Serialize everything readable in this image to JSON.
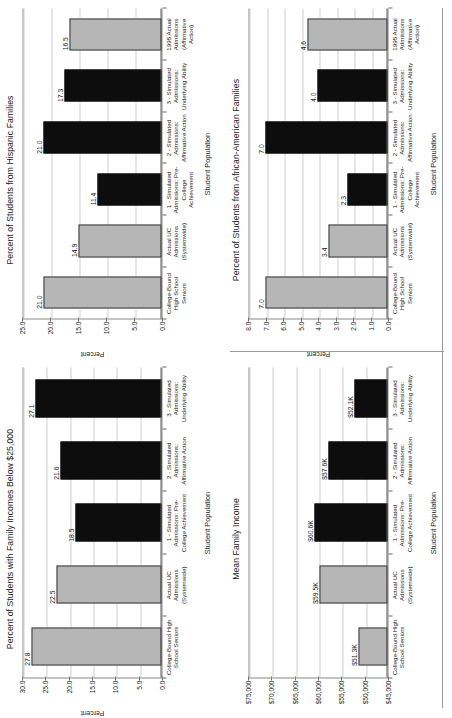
{
  "charts": [
    {
      "id": "hispanic-families",
      "position": "top-left",
      "chart_data": {
        "type": "bar",
        "title": "Percent of Students from Hispanic Families",
        "xlabel": "Student Population",
        "ylabel": "Percent",
        "ylim": [
          0.0,
          25.0
        ],
        "yticks": [
          "0.0",
          "5.0",
          "10.0",
          "15.0",
          "20.0",
          "25.0"
        ],
        "ytickvalues": [
          0,
          5,
          10,
          15,
          20,
          25
        ],
        "grid": true,
        "legend": "none",
        "categories": [
          "College-Bound High School Seniors",
          "Actual UC Admissions (Systemwide)",
          "1 - Simulated Admissions: Pre-College Achievement",
          "2 - Simulated Admissions: Affirmative Action",
          "3 - Simulated Admissions: Underlying Ability",
          "1995 Actual Admissions (Affirmative Action)"
        ],
        "values": [
          21.0,
          14.9,
          11.4,
          21.0,
          17.3,
          16.5
        ],
        "value_labels": [
          "21.0",
          "14.9",
          "11.4",
          "21.0",
          "17.3",
          "16.5"
        ],
        "colors": [
          "gray",
          "gray",
          "black",
          "black",
          "black",
          "gray"
        ]
      }
    },
    {
      "id": "african-american-families",
      "position": "top-right",
      "chart_data": {
        "type": "bar",
        "title": "Percent of Students from African-American Families",
        "xlabel": "Student Population",
        "ylabel": "Percent",
        "ylim": [
          0.0,
          8.0
        ],
        "yticks": [
          "0.0",
          "1.0",
          "2.0",
          "3.0",
          "4.0",
          "5.0",
          "6.0",
          "7.0",
          "8.0"
        ],
        "ytickvalues": [
          0,
          1,
          2,
          3,
          4,
          5,
          6,
          7,
          8
        ],
        "grid": true,
        "legend": "none",
        "categories": [
          "College-Bound High School Seniors",
          "Actual UC Admissions (Systemwide)",
          "1 - Simulated Admissions: Pre-College Achievement",
          "2 - Simulated Admissions: Affirmative Action",
          "3 - Simulated Admissions: Underlying Ability",
          "1995 Actual Admissions (Affirmative Action)"
        ],
        "values": [
          7.0,
          3.4,
          2.3,
          7.0,
          4.0,
          4.6
        ],
        "value_labels": [
          "7.0",
          "3.4",
          "2.3",
          "7.0",
          "4.0",
          "4.6"
        ],
        "colors": [
          "gray",
          "gray",
          "black",
          "black",
          "black",
          "gray"
        ]
      }
    },
    {
      "id": "family-incomes-below-25000",
      "position": "bottom-left",
      "chart_data": {
        "type": "bar",
        "title": "Percent of Students with Family Incomes Below $25,000",
        "xlabel": "Student Population",
        "ylabel": "Percent",
        "ylim": [
          0.0,
          30.0
        ],
        "yticks": [
          "0.0",
          "5.0",
          "10.0",
          "15.0",
          "20.0",
          "25.0",
          "30.0"
        ],
        "ytickvalues": [
          0,
          5,
          10,
          15,
          20,
          25,
          30
        ],
        "grid": true,
        "legend": "none",
        "categories": [
          "College-Bound High School Seniors",
          "Actual UC Admissions (Systemwide)",
          "1 - Simulated Admissions: Pre-College Achievement",
          "2 - Simulated Admissions: Affirmative Action",
          "3 - Simulated Admissions: Underlying Ability"
        ],
        "values": [
          27.8,
          22.5,
          18.5,
          21.6,
          27.1
        ],
        "value_labels": [
          "27.8",
          "22.5",
          "18.5",
          "21.6",
          "27.1"
        ],
        "colors": [
          "gray",
          "gray",
          "black",
          "black",
          "black"
        ]
      }
    },
    {
      "id": "mean-family-income",
      "position": "bottom-right",
      "chart_data": {
        "type": "bar",
        "title": "Mean Family Income",
        "xlabel": "Student Population",
        "ylabel": "",
        "ylim": [
          45000,
          75000
        ],
        "yticks": [
          "$45,000",
          "$50,000",
          "$55,000",
          "$60,000",
          "$65,000",
          "$70,000",
          "$75,000"
        ],
        "ytickvalues": [
          45000,
          50000,
          55000,
          60000,
          65000,
          70000,
          75000
        ],
        "grid": true,
        "legend": "none",
        "categories": [
          "College-Bound High School Seniors",
          "Actual UC Admissions (Systemwide)",
          "1 - Simulated Admissions: Pre-College Achievement",
          "2 - Simulated Admissions: Affirmative Action",
          "3 - Simulated Admissions: Underlying Ability"
        ],
        "values": [
          51300,
          59500,
          60600,
          57600,
          52100
        ],
        "value_labels": [
          "$51.3K",
          "$59.5K",
          "$60.6K",
          "$57.6K",
          "$52.1K"
        ],
        "colors": [
          "gray",
          "gray",
          "black",
          "black",
          "black"
        ]
      }
    }
  ],
  "style": {
    "bar_gray": "#b6b6b6",
    "bar_black": "#0d0d0d",
    "gridline": "#cfcfcf",
    "axis": "#5c5c5c",
    "text": "#1a1a1a",
    "background": "#ffffff"
  }
}
